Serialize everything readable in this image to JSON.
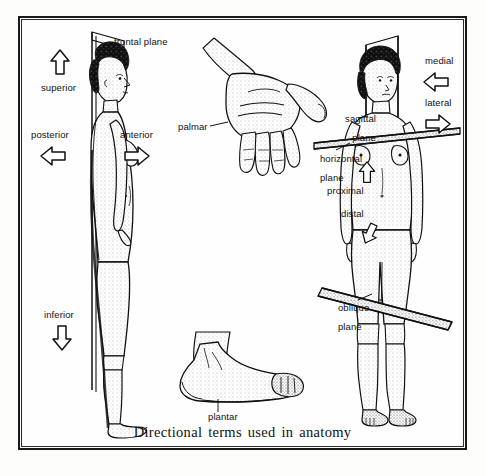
{
  "figure": {
    "caption": "Directional terms used in anatomy",
    "border_color": "#1a1a1a",
    "ink_color": "#111111",
    "paper_color": "#fefefe"
  },
  "lateral_figure": {
    "name": "female figure, lateral (side) view",
    "plane_label": "frontal plane",
    "direction_labels": [
      {
        "key": "superior",
        "text": "superior",
        "arrow": "up"
      },
      {
        "key": "inferior",
        "text": "inferior",
        "arrow": "down"
      },
      {
        "key": "posterior",
        "text": "posterior",
        "arrow": "left"
      },
      {
        "key": "anterior",
        "text": "anterior",
        "arrow": "right"
      }
    ]
  },
  "hand_figure": {
    "name": "open hand, palm view",
    "label": "palmar"
  },
  "foot_figure": {
    "name": "foot, lateral view",
    "label": "plantar"
  },
  "anterior_figure": {
    "name": "female figure, anterior (front) view",
    "plane_labels": [
      {
        "key": "sagittal",
        "line1": "sagittal",
        "line2": "plane"
      },
      {
        "key": "horizontal",
        "line1": "horizontal",
        "line2": "plane"
      },
      {
        "key": "oblique",
        "line1": "oblique",
        "line2": "plane"
      }
    ],
    "direction_labels": [
      {
        "key": "medial",
        "text": "medial",
        "arrow": "left"
      },
      {
        "key": "lateral",
        "text": "lateral",
        "arrow": "right"
      },
      {
        "key": "proximal",
        "text": "proximal",
        "arrow": "up"
      },
      {
        "key": "distal",
        "text": "distal",
        "arrow": "down-left"
      }
    ]
  }
}
